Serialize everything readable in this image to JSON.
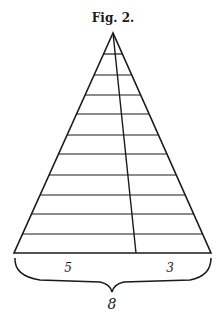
{
  "figure": {
    "caption": "Fig. 2.",
    "triangle": {
      "apex": [
        113,
        33
      ],
      "base_left": [
        14,
        253
      ],
      "base_right": [
        211,
        253
      ],
      "divider_bottom": [
        136,
        253
      ],
      "horizontal_lines_y": [
        54,
        75,
        95,
        114,
        135,
        154,
        175,
        195,
        214,
        234
      ]
    },
    "labels": {
      "left_segment": "5",
      "right_segment": "3",
      "total": "8"
    },
    "colors": {
      "line": "#1a1a1a",
      "background": "#ffffff"
    }
  }
}
